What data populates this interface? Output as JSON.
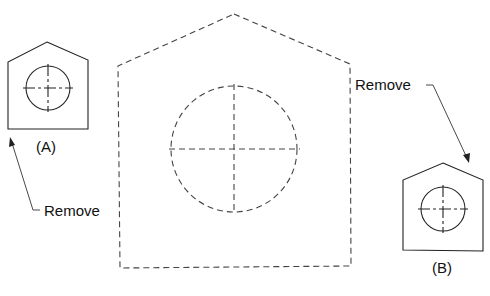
{
  "figure": {
    "center_view": {
      "style": "dashed",
      "description": "hidden-line view of pentagon plate with hole"
    },
    "view_a": {
      "label": "(A)"
    },
    "view_b": {
      "label": "(B)"
    },
    "callout_left": {
      "text": "Remove"
    },
    "callout_right": {
      "text": "Remove"
    }
  },
  "colors": {
    "line": "#222222",
    "dashed": "#444444",
    "background": "#ffffff"
  }
}
